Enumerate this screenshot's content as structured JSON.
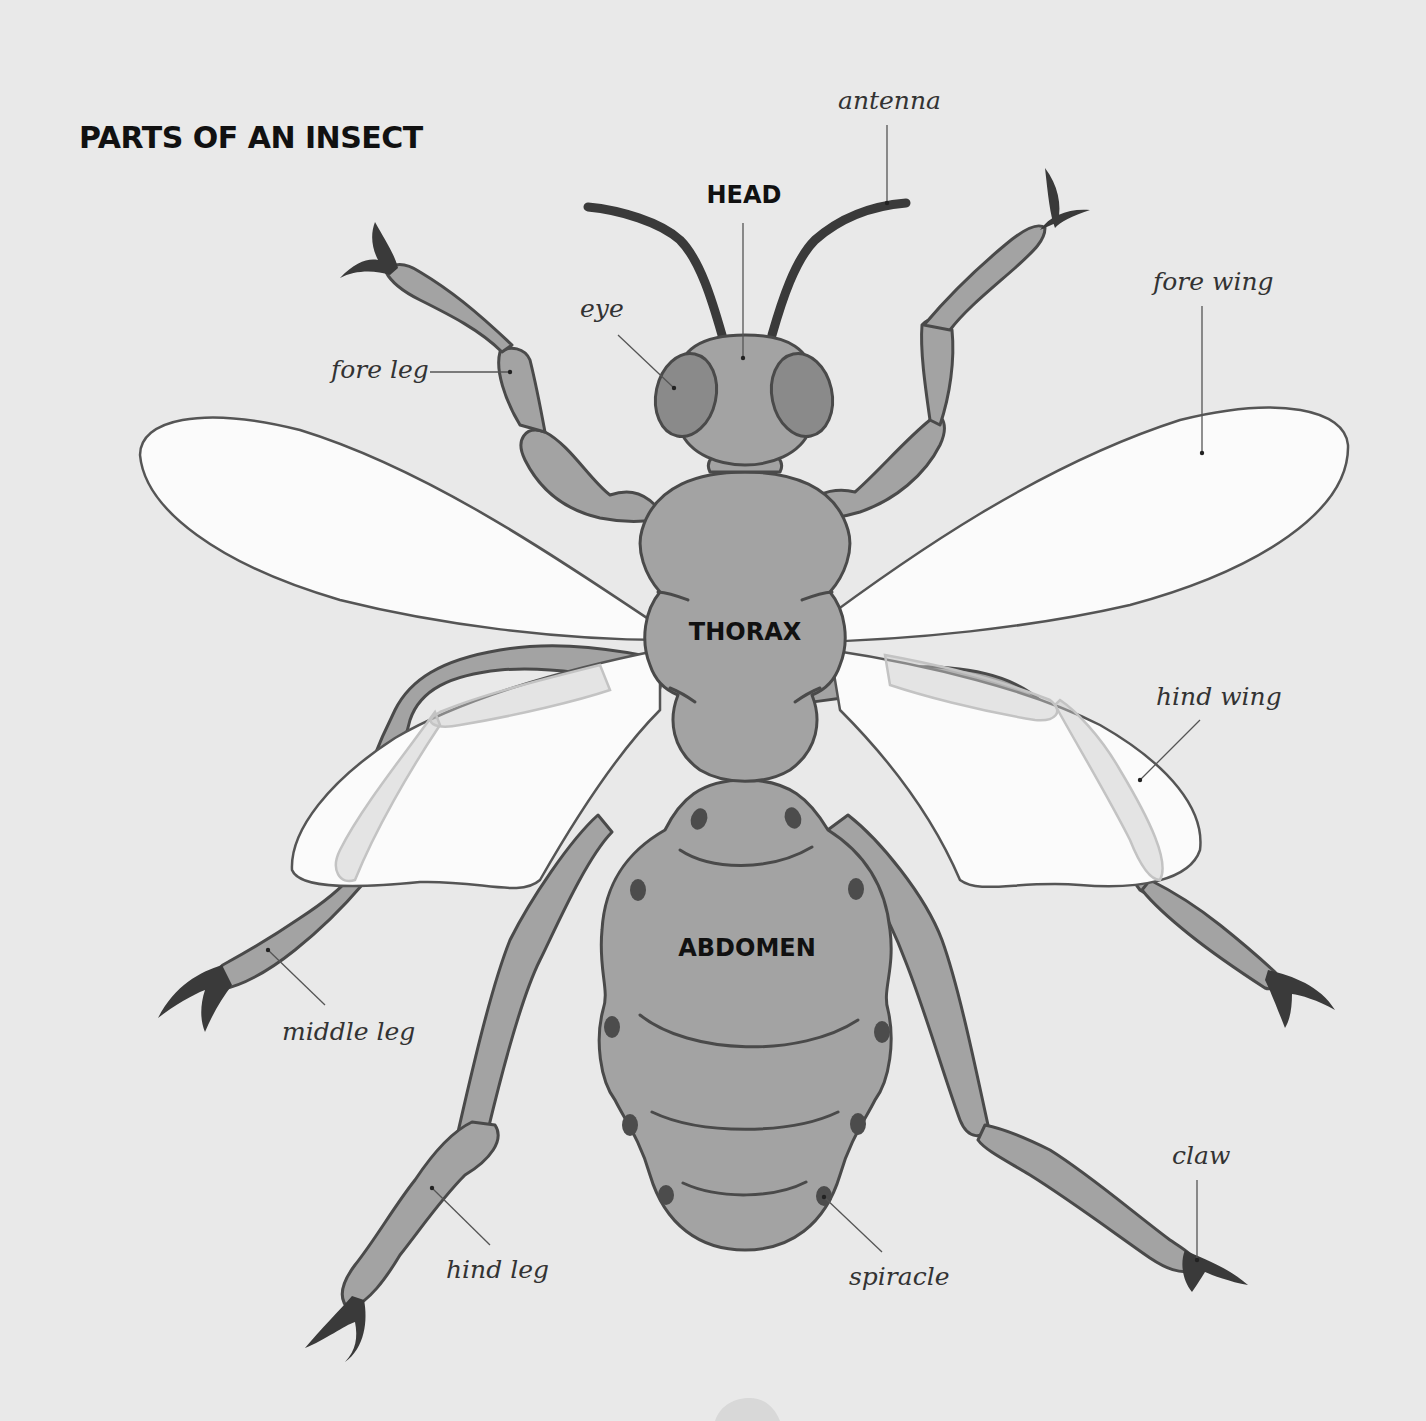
{
  "title": "PARTS OF AN INSECT",
  "regions": {
    "head": "HEAD",
    "thorax": "THORAX",
    "abdomen": "ABDOMEN"
  },
  "parts": {
    "antenna": "antenna",
    "eye": "eye",
    "fore_leg": "fore leg",
    "fore_wing": "fore wing",
    "hind_wing": "hind wing",
    "middle_leg": "middle leg",
    "hind_leg": "hind leg",
    "spiracle": "spiracle",
    "claw": "claw"
  },
  "colors": {
    "background": "#e9e9e9",
    "body": "#a3a3a3",
    "eye": "#8a8a8a",
    "outline": "#4a4a4a",
    "claw": "#3a3a3a",
    "wing": "#fbfbfb"
  }
}
